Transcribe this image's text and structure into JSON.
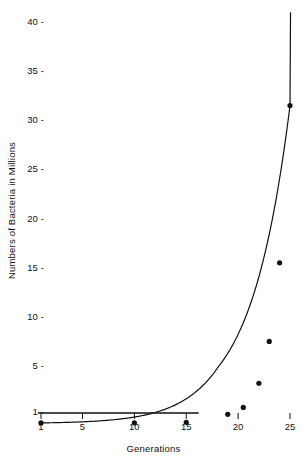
{
  "chart_data": {
    "type": "line",
    "title": "",
    "xlabel": "Generations",
    "ylabel": "Numbers of Bacteria in Millions",
    "x": [
      1,
      10,
      15,
      19,
      20.5,
      22,
      23,
      24,
      25
    ],
    "values": [
      0.05,
      0.06,
      0.1,
      0.8,
      1.4,
      3.5,
      7.5,
      15.5,
      31.5
    ],
    "series": [
      {
        "name": "Bacterial population",
        "values": [
          0.05,
          0.06,
          0.1,
          0.8,
          1.4,
          3.5,
          7.5,
          15.5,
          31.5
        ]
      }
    ],
    "xtick_labels": [
      "1",
      "5",
      "10",
      "15",
      "20",
      "25"
    ],
    "xtick_values": [
      1,
      5,
      10,
      15,
      20,
      25
    ],
    "ytick_labels": [
      "1",
      "5",
      "10",
      "15",
      "20",
      "25",
      "30",
      "35",
      "40"
    ],
    "ytick_values": [
      1,
      5,
      10,
      15,
      20,
      25,
      30,
      35,
      40
    ],
    "xlim": [
      0.2,
      25.6
    ],
    "ylim": [
      0,
      41
    ],
    "grid": false,
    "legend": false,
    "marker": "filled-circle",
    "line_color": "#111111",
    "marker_color": "#111111",
    "background": "#ffffff"
  }
}
